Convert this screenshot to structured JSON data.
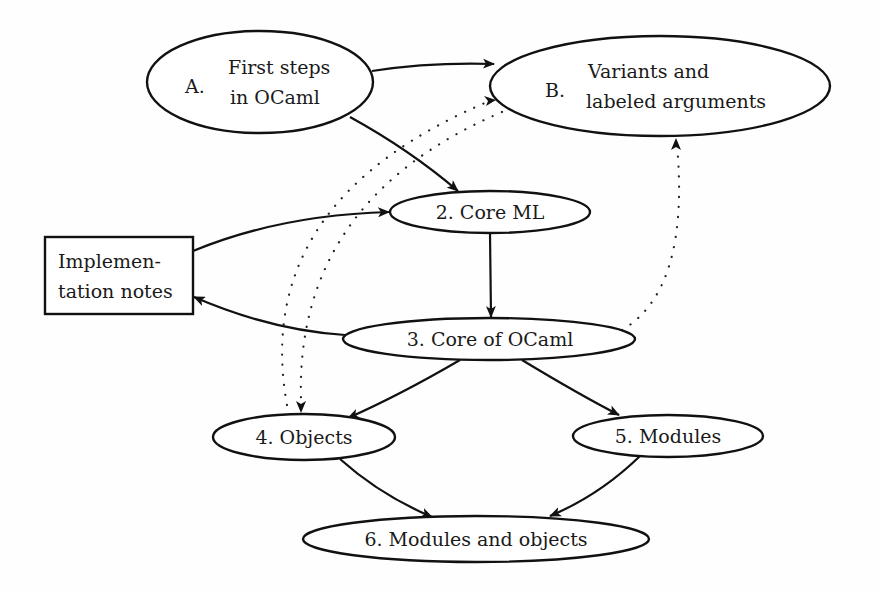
{
  "diagram": {
    "type": "dependency-graph",
    "nodes": [
      {
        "id": "A",
        "shape": "ellipse",
        "prefix": "A.",
        "lines": [
          "First steps",
          "in OCaml"
        ]
      },
      {
        "id": "B",
        "shape": "ellipse",
        "prefix": "B.",
        "lines": [
          "Variants and",
          "labeled arguments"
        ]
      },
      {
        "id": "n2",
        "shape": "ellipse",
        "label": "2.  Core ML"
      },
      {
        "id": "impl",
        "shape": "box",
        "lines": [
          "Implemen-",
          "tation notes"
        ]
      },
      {
        "id": "n3",
        "shape": "ellipse",
        "label": "3.  Core of OCaml"
      },
      {
        "id": "n4",
        "shape": "ellipse",
        "label": "4.  Objects"
      },
      {
        "id": "n5",
        "shape": "ellipse",
        "label": "5.  Modules"
      },
      {
        "id": "n6",
        "shape": "ellipse",
        "label": "6.  Modules and objects"
      }
    ],
    "edges": [
      {
        "from": "A",
        "to": "B",
        "style": "solid"
      },
      {
        "from": "A",
        "to": "n2",
        "style": "solid"
      },
      {
        "from": "impl",
        "to": "n2",
        "style": "solid"
      },
      {
        "from": "n2",
        "to": "n3",
        "style": "solid"
      },
      {
        "from": "n3",
        "to": "impl",
        "style": "solid"
      },
      {
        "from": "n3",
        "to": "n4",
        "style": "solid"
      },
      {
        "from": "n3",
        "to": "n5",
        "style": "solid"
      },
      {
        "from": "n4",
        "to": "n6",
        "style": "solid"
      },
      {
        "from": "n5",
        "to": "n6",
        "style": "solid"
      },
      {
        "from": "n3",
        "to": "B",
        "style": "dotted"
      },
      {
        "from": "n4",
        "to": "B",
        "style": "dotted"
      },
      {
        "from": "B",
        "to": "n4",
        "style": "dotted"
      }
    ]
  },
  "labels": {
    "a_prefix": "A.",
    "a_line1": "First steps",
    "a_line2": "in OCaml",
    "b_prefix": "B.",
    "b_line1": "Variants and",
    "b_line2": "labeled arguments",
    "n2": "2.  Core ML",
    "impl_line1": "Implemen-",
    "impl_line2": "tation notes",
    "n3": "3.  Core of OCaml",
    "n4": "4.  Objects",
    "n5": "5.  Modules",
    "n6": "6.  Modules and objects"
  },
  "colors": {
    "stroke": "#111111",
    "background": "#ffffff"
  }
}
